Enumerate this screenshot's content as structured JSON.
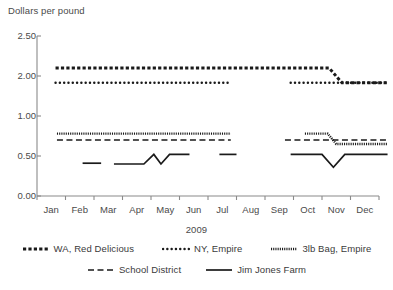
{
  "chart_data": {
    "type": "line",
    "title": "",
    "ylabel": "Dollars per pound",
    "xlabel": "2009",
    "grid": false,
    "legend_position": "bottom",
    "ylim": [
      0.0,
      2.5
    ],
    "ytick_labels": [
      "2.50",
      "2.00",
      "1.00",
      "0.50",
      "0.00"
    ],
    "ytick_values": [
      2.5,
      2.0,
      1.0,
      0.5,
      0.0
    ],
    "categories": [
      "Jan",
      "Feb",
      "Mar",
      "Apr",
      "May",
      "Jun",
      "Jul",
      "Aug",
      "Sep",
      "Oct",
      "Nov",
      "Dec"
    ],
    "series": [
      {
        "name": "WA, Red Delicious",
        "style": "square-dotted-thick",
        "segments": [
          {
            "points": [
              [
                0.15,
                2.1
              ],
              [
                9.75,
                2.1
              ],
              [
                10.2,
                1.83
              ],
              [
                11.85,
                1.83
              ]
            ]
          }
        ]
      },
      {
        "name": "NY, Empire",
        "style": "dotted-round",
        "segments": [
          {
            "points": [
              [
                0.15,
                1.83
              ],
              [
                6.3,
                1.83
              ]
            ]
          },
          {
            "points": [
              [
                8.4,
                1.83
              ],
              [
                11.85,
                1.83
              ]
            ]
          }
        ]
      },
      {
        "name": "3lb Bag, Empire",
        "style": "fine-dotted",
        "segments": [
          {
            "points": [
              [
                0.2,
                0.78
              ],
              [
                6.3,
                0.78
              ]
            ]
          },
          {
            "points": [
              [
                8.9,
                0.78
              ],
              [
                9.7,
                0.78
              ],
              [
                10.0,
                0.65
              ],
              [
                11.8,
                0.65
              ]
            ]
          }
        ]
      },
      {
        "name": "School District",
        "style": "dashed",
        "segments": [
          {
            "points": [
              [
                0.2,
                0.7
              ],
              [
                6.3,
                0.7
              ]
            ]
          },
          {
            "points": [
              [
                8.2,
                0.7
              ],
              [
                11.85,
                0.7
              ]
            ]
          }
        ]
      },
      {
        "name": "Jim Jones Farm",
        "style": "solid",
        "segments": [
          {
            "points": [
              [
                1.1,
                0.41
              ],
              [
                1.75,
                0.41
              ]
            ]
          },
          {
            "points": [
              [
                2.2,
                0.4
              ],
              [
                3.25,
                0.4
              ],
              [
                3.6,
                0.52
              ],
              [
                3.85,
                0.4
              ],
              [
                4.15,
                0.52
              ],
              [
                4.85,
                0.52
              ]
            ]
          },
          {
            "points": [
              [
                5.9,
                0.52
              ],
              [
                6.5,
                0.52
              ]
            ]
          },
          {
            "points": [
              [
                8.4,
                0.52
              ],
              [
                9.5,
                0.52
              ],
              [
                9.9,
                0.36
              ],
              [
                10.3,
                0.52
              ],
              [
                11.8,
                0.52
              ]
            ]
          }
        ]
      }
    ]
  },
  "legend": {
    "rows": [
      [
        {
          "label": "WA, Red Delicious",
          "style": "square-dotted-thick"
        },
        {
          "label": "NY, Empire",
          "style": "dotted-round"
        },
        {
          "label": "3lb Bag, Empire",
          "style": "fine-dotted"
        }
      ],
      [
        {
          "label": "School District",
          "style": "dashed"
        },
        {
          "label": "Jim Jones Farm",
          "style": "solid"
        }
      ]
    ]
  },
  "colors": {
    "line": "#1a1a1a",
    "axis": "#8a8a8a",
    "text": "#3a3a3a"
  }
}
